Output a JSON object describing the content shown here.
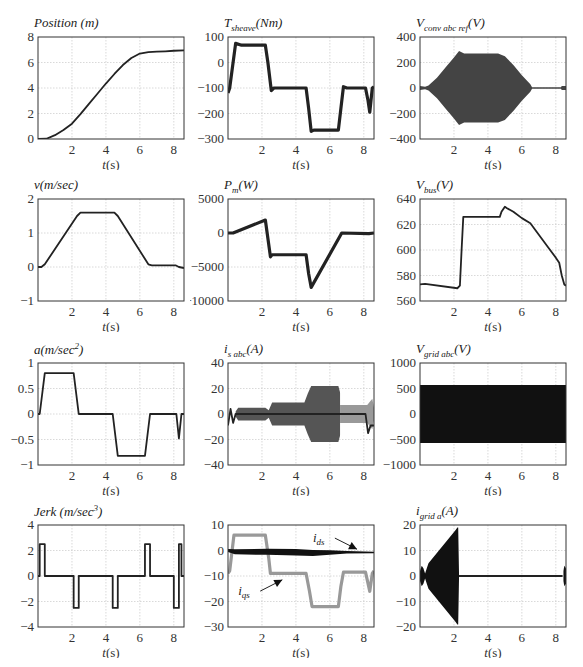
{
  "page": {
    "corner_text": ""
  },
  "chart_data": [
    {
      "id": "position",
      "type": "line",
      "title": "Position (m)",
      "xlabel": "t(s)",
      "ylabel": "",
      "xlim": [
        0,
        8.6
      ],
      "ylim": [
        0,
        8
      ],
      "xticks": [
        2,
        4,
        6,
        8
      ],
      "yticks": [
        0,
        2,
        4,
        6,
        8
      ],
      "grid": true,
      "series": [
        {
          "name": "position",
          "style": "line",
          "color": "#222222",
          "x": [
            0,
            0.5,
            1,
            1.5,
            2,
            2.5,
            3,
            3.5,
            4,
            4.5,
            5,
            5.5,
            6,
            6.5,
            7,
            7.5,
            8,
            8.6
          ],
          "y": [
            0,
            0.02,
            0.3,
            0.7,
            1.2,
            1.95,
            2.75,
            3.55,
            4.35,
            5.1,
            5.8,
            6.35,
            6.7,
            6.82,
            6.85,
            6.88,
            6.92,
            6.95
          ]
        }
      ]
    },
    {
      "id": "t_sheave",
      "type": "line",
      "title": "T_sheave(Nm)",
      "xlabel": "t(s)",
      "xlim": [
        0,
        8.6
      ],
      "ylim": [
        -300,
        100
      ],
      "xticks": [
        2,
        4,
        6,
        8
      ],
      "yticks": [
        -300,
        -200,
        -100,
        0,
        100
      ],
      "grid": true,
      "series": [
        {
          "name": "T_sheave",
          "style": "thick",
          "color": "#222222",
          "x": [
            0,
            0.1,
            0.45,
            0.8,
            2.2,
            2.35,
            2.55,
            2.7,
            4.6,
            4.75,
            4.9,
            5.05,
            6.5,
            6.65,
            6.8,
            7.0,
            8.1,
            8.25,
            8.35,
            8.5,
            8.6
          ],
          "y": [
            -120,
            -100,
            75,
            68,
            68,
            0,
            -110,
            -100,
            -100,
            -180,
            -270,
            -265,
            -265,
            -180,
            -95,
            -100,
            -100,
            -150,
            -195,
            -100,
            -95
          ]
        }
      ]
    },
    {
      "id": "v_conv_abc_ref",
      "type": "area",
      "title": "V_conv abc ref (V)",
      "xlabel": "t(s)",
      "xlim": [
        0,
        8.6
      ],
      "ylim": [
        -400,
        400
      ],
      "xticks": [
        2,
        4,
        6,
        8
      ],
      "yticks": [
        -400,
        -200,
        0,
        200,
        400
      ],
      "grid": true,
      "series": [
        {
          "name": "envelope",
          "style": "envelope",
          "color": "#444444",
          "x": [
            0,
            0.3,
            0.5,
            1.0,
            1.5,
            2.0,
            2.3,
            2.6,
            4.6,
            5.0,
            5.5,
            6.0,
            6.5,
            6.6,
            8.3,
            8.35,
            8.6
          ],
          "y": [
            15,
            10,
            20,
            80,
            160,
            240,
            290,
            270,
            270,
            250,
            180,
            100,
            30,
            5,
            5,
            15,
            15
          ]
        }
      ]
    },
    {
      "id": "velocity",
      "type": "line",
      "title": "v(m/sec)",
      "xlabel": "t(s)",
      "xlim": [
        0,
        8.6
      ],
      "ylim": [
        -1,
        2
      ],
      "xticks": [
        2,
        4,
        6,
        8
      ],
      "yticks": [
        -1,
        0,
        1,
        2
      ],
      "grid": true,
      "series": [
        {
          "name": "v",
          "style": "line",
          "color": "#222222",
          "x": [
            0,
            0.2,
            0.4,
            2.3,
            2.5,
            4.5,
            4.7,
            6.5,
            6.7,
            8.1,
            8.3,
            8.6
          ],
          "y": [
            0,
            0,
            0.08,
            1.5,
            1.6,
            1.6,
            1.5,
            0.08,
            0.05,
            0.05,
            0.0,
            -0.03
          ]
        }
      ]
    },
    {
      "id": "p_m",
      "type": "line",
      "title": "P_m(W)",
      "xlabel": "t(s)",
      "xlim": [
        0,
        8.6
      ],
      "ylim": [
        -10000,
        5000
      ],
      "xticks": [
        2,
        4,
        6,
        8
      ],
      "yticks": [
        -10000,
        -5000,
        0,
        5000
      ],
      "grid": true,
      "series": [
        {
          "name": "P_m",
          "style": "thick",
          "color": "#222222",
          "x": [
            0,
            0.3,
            2.2,
            2.5,
            2.6,
            4.6,
            4.75,
            4.9,
            6.7,
            8.3,
            8.6
          ],
          "y": [
            0,
            0,
            1900,
            -3500,
            -3200,
            -3200,
            -6000,
            -8000,
            0,
            -100,
            0
          ]
        }
      ]
    },
    {
      "id": "v_bus",
      "type": "line",
      "title": "V_bus(V)",
      "xlabel": "t(s)",
      "xlim": [
        0,
        8.6
      ],
      "ylim": [
        560,
        640
      ],
      "xticks": [
        2,
        4,
        6,
        8
      ],
      "yticks": [
        560,
        580,
        600,
        620,
        640
      ],
      "grid": true,
      "series": [
        {
          "name": "V_bus",
          "style": "line",
          "color": "#222222",
          "x": [
            0,
            0.3,
            2.2,
            2.35,
            2.45,
            2.55,
            4.7,
            4.8,
            5.0,
            5.1,
            5.5,
            6.0,
            6.5,
            7.0,
            7.5,
            8.0,
            8.2,
            8.35,
            8.5,
            8.6
          ],
          "y": [
            573,
            573.5,
            570,
            572,
            600,
            626,
            626,
            630,
            634,
            633,
            630,
            625,
            621,
            612,
            603,
            594,
            590,
            580,
            573,
            572
          ]
        }
      ]
    },
    {
      "id": "acceleration",
      "type": "line",
      "title": "a(m/sec^2)",
      "xlabel": "t(s)",
      "xlim": [
        0,
        8.6
      ],
      "ylim": [
        -1,
        1
      ],
      "xticks": [
        2,
        4,
        6,
        8
      ],
      "yticks": [
        -1,
        -0.5,
        0,
        0.5,
        1
      ],
      "grid": true,
      "series": [
        {
          "name": "a",
          "style": "line",
          "color": "#222222",
          "x": [
            0,
            0.1,
            0.4,
            2.1,
            2.4,
            4.4,
            4.7,
            6.3,
            6.6,
            8.0,
            8.15,
            8.3,
            8.45,
            8.6
          ],
          "y": [
            0,
            0,
            0.8,
            0.8,
            0,
            0,
            -0.82,
            -0.82,
            0,
            0,
            0,
            -0.48,
            0,
            0
          ]
        }
      ]
    },
    {
      "id": "i_s_abc",
      "type": "area",
      "title": "i_s abc(A)",
      "xlabel": "t(s)",
      "xlim": [
        0,
        8.6
      ],
      "ylim": [
        -40,
        40
      ],
      "xticks": [
        2,
        4,
        6,
        8
      ],
      "yticks": [
        -40,
        -20,
        0,
        20,
        40
      ],
      "grid": true,
      "series": [
        {
          "name": "envelope",
          "style": "envelope",
          "color": "#555555",
          "x": [
            0.45,
            0.6,
            2.2,
            2.4,
            2.6,
            4.5,
            4.7,
            4.9,
            6.5,
            6.6
          ],
          "y": [
            2,
            5,
            5,
            3,
            9,
            9,
            16,
            22,
            22,
            17
          ]
        },
        {
          "name": "ripple",
          "style": "envelope",
          "color": "#999999",
          "x": [
            6.6,
            6.8,
            8.2,
            8.5,
            8.6
          ],
          "y": [
            7,
            7,
            7,
            12,
            5
          ]
        },
        {
          "name": "trace",
          "style": "line",
          "color": "#222222",
          "x": [
            0,
            0.15,
            0.3,
            0.45,
            8.1,
            8.25,
            8.4,
            8.6
          ],
          "y": [
            -9,
            4,
            -7,
            0,
            0,
            -15,
            -9,
            -9
          ]
        }
      ]
    },
    {
      "id": "v_grid_abc",
      "type": "area",
      "title": "V_grid abc(V)",
      "xlabel": "t(s)",
      "xlim": [
        0,
        8.6
      ],
      "ylim": [
        -1000,
        1000
      ],
      "xticks": [
        2,
        4,
        6,
        8
      ],
      "yticks": [
        -1000,
        -500,
        0,
        500,
        1000
      ],
      "grid": true,
      "series": [
        {
          "name": "envelope",
          "style": "envelope",
          "color": "#111111",
          "x": [
            0,
            8.6
          ],
          "y": [
            570,
            570
          ]
        }
      ]
    },
    {
      "id": "jerk",
      "type": "line",
      "title": "Jerk (m/sec^3)",
      "xlabel": "t(s)",
      "xlim": [
        0,
        8.6
      ],
      "ylim": [
        -4,
        4
      ],
      "xticks": [
        2,
        4,
        6,
        8
      ],
      "yticks": [
        -4,
        -2,
        0,
        2,
        4
      ],
      "grid": true,
      "series": [
        {
          "name": "jerk",
          "style": "step",
          "color": "#222222",
          "x": [
            0,
            0.1,
            0.1,
            0.4,
            0.4,
            2.1,
            2.1,
            2.4,
            2.4,
            4.4,
            4.4,
            4.7,
            4.7,
            6.3,
            6.3,
            6.6,
            6.6,
            8.0,
            8.0,
            8.3,
            8.3,
            8.45,
            8.45,
            8.6
          ],
          "y": [
            0,
            0,
            2.5,
            2.5,
            0,
            0,
            -2.5,
            -2.5,
            0,
            0,
            -2.5,
            -2.5,
            0,
            0,
            2.5,
            2.5,
            0,
            0,
            -2.5,
            -2.5,
            2.5,
            2.5,
            0,
            0
          ]
        }
      ]
    },
    {
      "id": "i_dq",
      "type": "line",
      "title": "",
      "xlabel": "t(s)",
      "xlim": [
        0,
        8.6
      ],
      "ylim": [
        -30,
        10
      ],
      "xticks": [
        2,
        4,
        6,
        8
      ],
      "yticks": [
        -30,
        -20,
        -10,
        0,
        10
      ],
      "grid": true,
      "annotations": [
        {
          "text": "i_ds",
          "x": 5.0,
          "y": 3.3,
          "arrow_to": [
            7.6,
            0.5
          ]
        },
        {
          "text": "i_qs",
          "x": 0.6,
          "y": -17.5,
          "arrow_to": [
            3.2,
            -11.5
          ]
        }
      ],
      "series": [
        {
          "name": "i_qs",
          "style": "thick",
          "color": "#999999",
          "x": [
            0,
            0.1,
            0.35,
            2.2,
            2.4,
            2.5,
            4.6,
            4.8,
            4.95,
            6.5,
            6.65,
            6.8,
            8.1,
            8.25,
            8.35,
            8.5,
            8.6
          ],
          "y": [
            -9,
            -8,
            6,
            6,
            -3,
            -9,
            -9,
            -16,
            -22,
            -22,
            -14,
            -8.5,
            -8.5,
            -13,
            -16,
            -9,
            -8
          ]
        },
        {
          "name": "i_ds",
          "style": "band",
          "color": "#111111",
          "x": [
            0,
            0.4,
            2.3,
            4.0,
            5.0,
            6.0,
            7.0,
            8.6
          ],
          "y": [
            0,
            -0.5,
            -0.5,
            -0.7,
            -1.0,
            -0.8,
            -0.7,
            -0.8
          ],
          "band": [
            0.6,
            1.0,
            1.2,
            1.3,
            1.2,
            0.9,
            0.5,
            0.3
          ]
        }
      ]
    },
    {
      "id": "i_grid_a",
      "type": "area",
      "title": "i_grid a(A)",
      "xlabel": "t(s)",
      "xlim": [
        0,
        8.6
      ],
      "ylim": [
        -20,
        20
      ],
      "xticks": [
        2,
        4,
        6,
        8
      ],
      "yticks": [
        -20,
        -10,
        0,
        10,
        20
      ],
      "grid": true,
      "series": [
        {
          "name": "envelope",
          "style": "envelope",
          "color": "#111111",
          "x": [
            0,
            0.1,
            0.2,
            0.3,
            0.4,
            0.5,
            2.1,
            2.2,
            2.25,
            2.3
          ],
          "y": [
            2,
            4,
            3,
            1,
            3,
            5,
            18,
            19,
            19,
            0.3
          ]
        },
        {
          "name": "trace",
          "style": "line",
          "color": "#222222",
          "x": [
            2.3,
            8.4
          ],
          "y": [
            0,
            0
          ]
        },
        {
          "name": "end_burst",
          "style": "envelope",
          "color": "#111111",
          "x": [
            8.45,
            8.5,
            8.6
          ],
          "y": [
            2,
            4,
            3
          ]
        }
      ]
    }
  ]
}
